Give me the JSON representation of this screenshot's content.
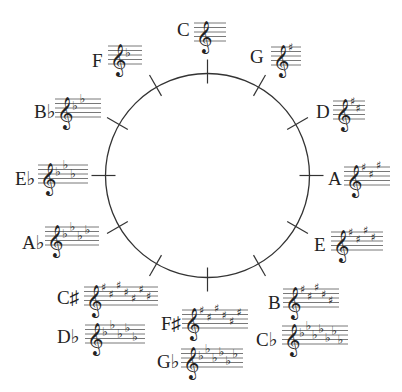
{
  "circle": {
    "cx": 207.5,
    "cy": 175.5,
    "r": 102,
    "stroke": "#333333",
    "tick_inner": 10,
    "tick_outer": 14,
    "tick_count": 12
  },
  "colors": {
    "ink": "#222222",
    "staff_line": "#555555",
    "background": "#ffffff"
  },
  "keys": [
    {
      "name": "C",
      "accidental_type": "none",
      "count": 0,
      "label_x": 177,
      "label_y": 20,
      "staff_x": 194,
      "staff_y": 23,
      "staff_w": 32
    },
    {
      "name": "G",
      "accidental_type": "sharp",
      "count": 1,
      "label_x": 250,
      "label_y": 47,
      "staff_x": 271,
      "staff_y": 47,
      "staff_w": 30
    },
    {
      "name": "D",
      "accidental_type": "sharp",
      "count": 2,
      "label_x": 316,
      "label_y": 102,
      "staff_x": 333,
      "staff_y": 101,
      "staff_w": 32
    },
    {
      "name": "A",
      "accidental_type": "sharp",
      "count": 3,
      "label_x": 328,
      "label_y": 169,
      "staff_x": 344,
      "staff_y": 167,
      "staff_w": 46
    },
    {
      "name": "E",
      "accidental_type": "sharp",
      "count": 4,
      "label_x": 314,
      "label_y": 235,
      "staff_x": 331,
      "staff_y": 232,
      "staff_w": 52
    },
    {
      "name": "B",
      "accidental_type": "sharp",
      "count": 5,
      "label_x": 268,
      "label_y": 293,
      "staff_x": 283,
      "staff_y": 289,
      "staff_w": 56
    },
    {
      "name": "C♭",
      "accidental_type": "flat",
      "count": 7,
      "label_x": 256,
      "label_y": 330,
      "staff_x": 282,
      "staff_y": 326,
      "staff_w": 66
    },
    {
      "name": "F♯",
      "accidental_type": "sharp",
      "count": 6,
      "label_x": 161,
      "label_y": 314,
      "staff_x": 182,
      "staff_y": 310,
      "staff_w": 66
    },
    {
      "name": "G♭",
      "accidental_type": "flat",
      "count": 6,
      "label_x": 157,
      "label_y": 352,
      "staff_x": 181,
      "staff_y": 349,
      "staff_w": 62
    },
    {
      "name": "C♯",
      "accidental_type": "sharp",
      "count": 7,
      "label_x": 57,
      "label_y": 288,
      "staff_x": 84,
      "staff_y": 287,
      "staff_w": 74
    },
    {
      "name": "D♭",
      "accidental_type": "flat",
      "count": 5,
      "label_x": 57,
      "label_y": 327,
      "staff_x": 85,
      "staff_y": 325,
      "staff_w": 60
    },
    {
      "name": "A♭",
      "accidental_type": "flat",
      "count": 4,
      "label_x": 22,
      "label_y": 233,
      "staff_x": 45,
      "staff_y": 227,
      "staff_w": 54
    },
    {
      "name": "E♭",
      "accidental_type": "flat",
      "count": 3,
      "label_x": 15,
      "label_y": 169,
      "staff_x": 38,
      "staff_y": 165,
      "staff_w": 50
    },
    {
      "name": "B♭",
      "accidental_type": "flat",
      "count": 2,
      "label_x": 34,
      "label_y": 102,
      "staff_x": 55,
      "staff_y": 99,
      "staff_w": 46
    },
    {
      "name": "F",
      "accidental_type": "flat",
      "count": 1,
      "label_x": 92,
      "label_y": 51,
      "staff_x": 108,
      "staff_y": 46,
      "staff_w": 34
    }
  ],
  "sharp_positions": [
    0,
    3,
    -1,
    2,
    5,
    1,
    4
  ],
  "flat_positions": [
    4,
    1,
    5,
    2,
    6,
    3,
    7
  ]
}
